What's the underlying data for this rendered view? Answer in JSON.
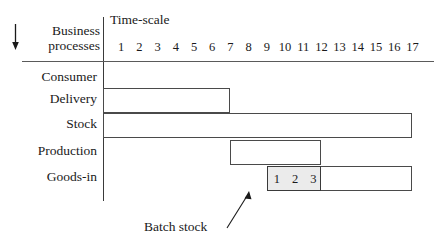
{
  "figure": {
    "axis_corner_label_line1": "Business",
    "axis_corner_label_line2": "processes",
    "timescale_title": "Time-scale",
    "down_arrow_icon": "down-arrow-icon",
    "annotation": {
      "label": "Batch stock",
      "arrow_icon": "annotation-arrow-icon"
    }
  },
  "chart_data": {
    "type": "bar",
    "title": "Time-scale",
    "xlabel": "Time-scale",
    "ylabel": "Business processes",
    "orientation": "horizontal",
    "grid": false,
    "legend": "none",
    "xlim": [
      0,
      17.5
    ],
    "xticks": [
      1,
      2,
      3,
      4,
      5,
      6,
      7,
      8,
      9,
      10,
      11,
      12,
      13,
      14,
      15,
      16,
      17
    ],
    "xticklabels": [
      "1",
      "2",
      "3",
      "4",
      "5",
      "6",
      "7",
      "8",
      "9",
      "10",
      "11",
      "12",
      "13",
      "14",
      "15",
      "16",
      "17"
    ],
    "categories": [
      "Consumer",
      "Delivery",
      "Stock",
      "Production",
      "Goods-in"
    ],
    "bars": [
      {
        "category": "Consumer",
        "start": null,
        "end": null,
        "shaded": false,
        "has_bar": false
      },
      {
        "category": "Delivery",
        "start": 0,
        "end": 7,
        "shaded": false,
        "has_bar": true
      },
      {
        "category": "Stock",
        "start": 0,
        "end": 17,
        "shaded": false,
        "has_bar": true
      },
      {
        "category": "Production",
        "start": 7,
        "end": 12,
        "shaded": false,
        "has_bar": true
      },
      {
        "category": "Goods-in",
        "start": 9,
        "end": 17,
        "shaded": false,
        "has_bar": true
      }
    ],
    "batch_stock": {
      "category": "Goods-in",
      "start": 9,
      "end": 12,
      "shaded": true,
      "cell_labels": [
        "1",
        "2",
        "3"
      ]
    },
    "annotations": [
      {
        "text": "Batch stock",
        "points_to": "batch_stock"
      }
    ]
  },
  "colors": {
    "background": "#ffffff",
    "ink": "#1a1a1a",
    "rule": "#5a5a5a",
    "bar_stroke": "#4a4a4a",
    "batch_fill": "#ebebeb"
  }
}
